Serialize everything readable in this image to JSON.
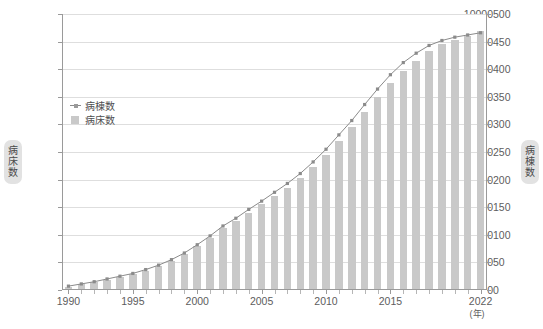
{
  "chart_data": {
    "type": "bar",
    "title": "",
    "subtitle": "",
    "xlabel": "(年)",
    "ylabel": "病床数",
    "y2label": "病棟数",
    "grid": true,
    "legend_position": "top-left-inside",
    "ylim": [
      0,
      10000
    ],
    "y2lim": [
      0,
      500
    ],
    "yticks": [
      0,
      1000,
      2000,
      3000,
      4000,
      5000,
      6000,
      7000,
      8000,
      9000,
      10000
    ],
    "y2ticks": [
      0,
      50,
      100,
      150,
      200,
      250,
      300,
      350,
      400,
      450,
      500
    ],
    "xticks": [
      1990,
      1995,
      2000,
      2005,
      2010,
      2015,
      2022
    ],
    "categories": [
      1990,
      1991,
      1992,
      1993,
      1994,
      1995,
      1996,
      1997,
      1998,
      1999,
      2000,
      2001,
      2002,
      2003,
      2004,
      2005,
      2006,
      2007,
      2008,
      2009,
      2010,
      2011,
      2012,
      2013,
      2014,
      2015,
      2016,
      2017,
      2018,
      2019,
      2020,
      2021,
      2022
    ],
    "series": [
      {
        "name": "病床数",
        "type": "bar",
        "axis": "left",
        "color": "#c9c9c9",
        "values": [
          120,
          200,
          290,
          380,
          470,
          570,
          700,
          860,
          1050,
          1300,
          1600,
          1900,
          2250,
          2500,
          2800,
          3100,
          3400,
          3700,
          4050,
          4450,
          4900,
          5400,
          5900,
          6450,
          7000,
          7500,
          7950,
          8300,
          8650,
          8900,
          9050,
          9200,
          9400
        ]
      },
      {
        "name": "病棟数",
        "type": "line",
        "axis": "right",
        "color": "#8b8b8b",
        "values": [
          7,
          11,
          15,
          20,
          25,
          30,
          37,
          45,
          55,
          67,
          82,
          98,
          116,
          130,
          146,
          161,
          177,
          193,
          211,
          232,
          255,
          281,
          307,
          336,
          364,
          390,
          412,
          429,
          443,
          452,
          458,
          462,
          466
        ]
      }
    ]
  },
  "legend": {
    "items": [
      {
        "label": "病棟数",
        "marker": "line-marker-icon"
      },
      {
        "label": "病床数",
        "marker": "square-marker-icon"
      }
    ]
  },
  "axis_titles": {
    "left": [
      "病",
      "床",
      "数"
    ],
    "right": [
      "病",
      "棟",
      "数"
    ]
  }
}
